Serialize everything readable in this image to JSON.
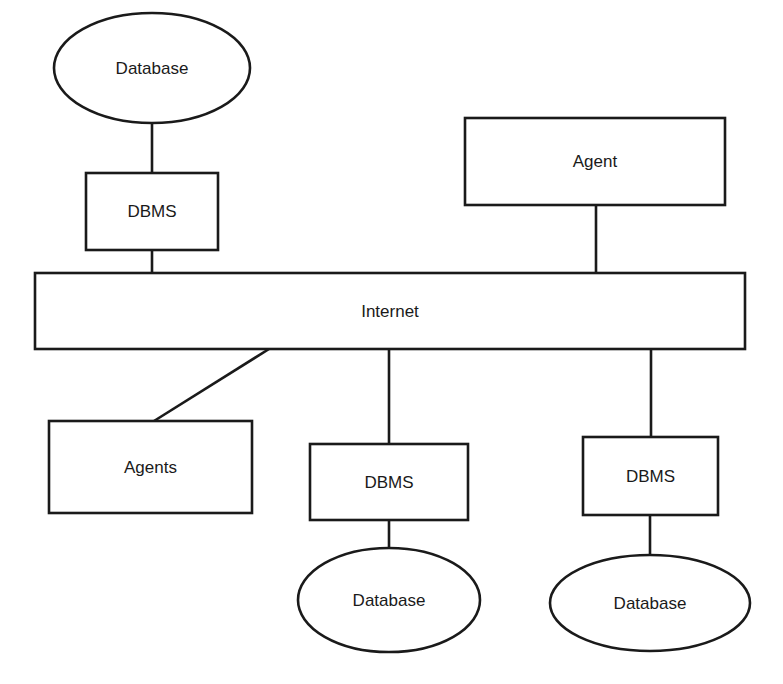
{
  "diagram": {
    "type": "network-architecture",
    "colors": {
      "stroke": "#1a1a1a",
      "fill": "#ffffff",
      "text": "#1a1a1a"
    },
    "nodes": [
      {
        "id": "db_top",
        "shape": "ellipse",
        "label": "Database",
        "cx": 152,
        "cy": 68,
        "rx": 98,
        "ry": 55
      },
      {
        "id": "dbms_top",
        "shape": "rect",
        "label": "DBMS",
        "x": 86,
        "y": 173,
        "w": 132,
        "h": 77
      },
      {
        "id": "agent_top",
        "shape": "rect",
        "label": "Agent",
        "x": 465,
        "y": 118,
        "w": 260,
        "h": 87
      },
      {
        "id": "internet",
        "shape": "rect",
        "label": "Internet",
        "x": 35,
        "y": 273,
        "w": 710,
        "h": 76
      },
      {
        "id": "agents",
        "shape": "rect",
        "label": "Agents",
        "x": 49,
        "y": 421,
        "w": 203,
        "h": 92
      },
      {
        "id": "dbms_mid",
        "shape": "rect",
        "label": "DBMS",
        "x": 310,
        "y": 444,
        "w": 158,
        "h": 76
      },
      {
        "id": "db_mid",
        "shape": "ellipse",
        "label": "Database",
        "cx": 389,
        "cy": 600,
        "rx": 91,
        "ry": 52
      },
      {
        "id": "dbms_right",
        "shape": "rect",
        "label": "DBMS",
        "x": 583,
        "y": 437,
        "w": 135,
        "h": 78
      },
      {
        "id": "db_right",
        "shape": "ellipse",
        "label": "Database",
        "cx": 650,
        "cy": 603,
        "rx": 100,
        "ry": 48
      }
    ],
    "edges": [
      {
        "from": "db_top",
        "to": "dbms_top",
        "x1": 152,
        "y1": 123,
        "x2": 152,
        "y2": 173
      },
      {
        "from": "dbms_top",
        "to": "internet",
        "x1": 152,
        "y1": 250,
        "x2": 152,
        "y2": 273
      },
      {
        "from": "agent_top",
        "to": "internet",
        "x1": 596,
        "y1": 205,
        "x2": 596,
        "y2": 273
      },
      {
        "from": "internet",
        "to": "agents",
        "x1": 269,
        "y1": 349,
        "x2": 154,
        "y2": 421
      },
      {
        "from": "internet",
        "to": "dbms_mid",
        "x1": 389,
        "y1": 349,
        "x2": 389,
        "y2": 444
      },
      {
        "from": "dbms_mid",
        "to": "db_mid",
        "x1": 389,
        "y1": 520,
        "x2": 389,
        "y2": 548
      },
      {
        "from": "internet",
        "to": "dbms_right",
        "x1": 651,
        "y1": 349,
        "x2": 651,
        "y2": 437
      },
      {
        "from": "dbms_right",
        "to": "db_right",
        "x1": 650,
        "y1": 515,
        "x2": 650,
        "y2": 555
      }
    ]
  }
}
